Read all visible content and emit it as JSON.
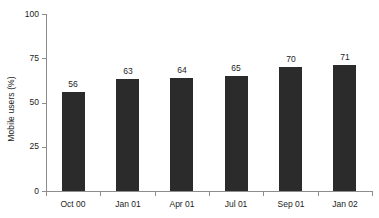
{
  "chart_data": {
    "type": "bar",
    "title": "",
    "subtitle": "",
    "xlabel": "",
    "ylabel": "Mobile users (%)",
    "categories": [
      "Oct 00",
      "Jan 01",
      "Apr 01",
      "Jul 01",
      "Sep 01",
      "Jan 02"
    ],
    "values": [
      56,
      63,
      64,
      65,
      70,
      71
    ],
    "value_labels": [
      "56",
      "63",
      "64",
      "65",
      "70",
      "71"
    ],
    "ylim": [
      0,
      100
    ],
    "ytick_values": [
      0,
      25,
      50,
      75,
      100
    ],
    "ytick_labels": [
      "0",
      "25",
      "50",
      "75",
      "100"
    ],
    "grid": false,
    "legend": null,
    "legend_position": "none",
    "colors": {
      "bar": "#2b2b2b",
      "axis": "#8d8d8d",
      "text": "#1d1d1d",
      "background": "#ffffff"
    }
  }
}
